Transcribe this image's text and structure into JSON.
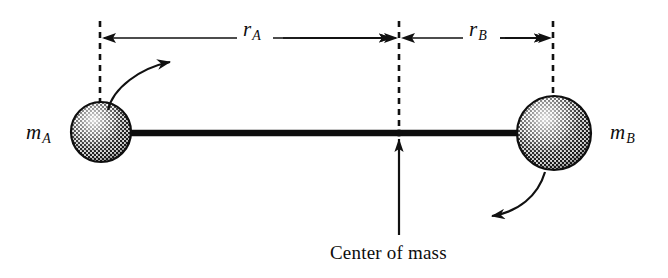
{
  "figure": {
    "background_color": "#ffffff",
    "ink_color": "#111111",
    "width": 668,
    "height": 278
  },
  "labels": {
    "mass_a": {
      "symbol": "m",
      "subscript": "A",
      "text": "mA"
    },
    "mass_b": {
      "symbol": "m",
      "subscript": "B",
      "text": "mB"
    },
    "radius_a": {
      "symbol": "r",
      "subscript": "A",
      "text": "rA"
    },
    "radius_b": {
      "symbol": "r",
      "subscript": "B",
      "text": "rB"
    },
    "center_of_mass": "Center of mass"
  },
  "elements": {
    "sphere_a": {
      "name": "mass-a-sphere",
      "cx": 101,
      "cy": 132,
      "r": 30,
      "fill": "#7d7d7d"
    },
    "sphere_b": {
      "name": "mass-b-sphere",
      "cx": 554,
      "cy": 133,
      "r": 37,
      "fill": "#7d7d7d"
    },
    "rod": {
      "name": "connecting-rod",
      "x1": 101,
      "x2": 554,
      "y": 133,
      "thickness": 6
    },
    "center_point": {
      "name": "center-of-mass-point",
      "x": 399,
      "y": 133
    },
    "dimension_line_y": 38,
    "extension_left_x": 100,
    "extension_center_x": 399,
    "extension_right_x": 553,
    "rotation_arrow_a": "curved arrow, counterclockwise sweep up and to the right from top of mass A",
    "rotation_arrow_b": "curved arrow, sweeping down and to the left from bottom of mass B",
    "pointer_arrow": "vertical arrow pointing up from Center of mass label to the rod"
  }
}
